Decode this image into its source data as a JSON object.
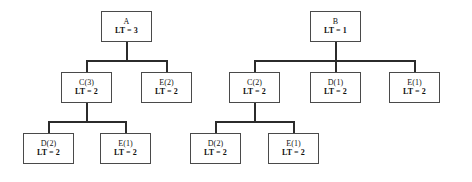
{
  "diagram": {
    "type": "tree",
    "title": "",
    "background_color": "#ffffff",
    "box_border_color": "#4a4a4a",
    "edge_color": "#2b2b2b",
    "text_color": "#111111",
    "trees": [
      {
        "name": "tree-a",
        "root": "A",
        "nodes": [
          {
            "id": "a-root",
            "name": "node-a-root",
            "label": "A",
            "value": "LT = 3",
            "lt": 3,
            "level": 0,
            "x": 101,
            "y": 11,
            "w": 51,
            "h": 31
          },
          {
            "id": "a-c3",
            "name": "node-a-c3",
            "label": "C(3)",
            "value": "LT = 2",
            "lt": 2,
            "level": 1,
            "x": 61,
            "y": 72,
            "w": 51,
            "h": 31
          },
          {
            "id": "a-e2",
            "name": "node-a-e2",
            "label": "E(2)",
            "value": "LT = 2",
            "lt": 2,
            "level": 1,
            "x": 141,
            "y": 72,
            "w": 51,
            "h": 31
          },
          {
            "id": "a-d2",
            "name": "node-a-d2",
            "label": "D(2)",
            "value": "LT = 2",
            "lt": 2,
            "level": 2,
            "x": 23,
            "y": 133,
            "w": 51,
            "h": 31
          },
          {
            "id": "a-e1",
            "name": "node-a-e1",
            "label": "E(1)",
            "value": "LT = 2",
            "lt": 2,
            "level": 2,
            "x": 100,
            "y": 133,
            "w": 51,
            "h": 31
          }
        ],
        "links": [
          {
            "name": "edge-a-root-to-children",
            "from": "a-root",
            "to": [
              "a-c3",
              "a-e2"
            ]
          },
          {
            "name": "edge-a-c3-to-children",
            "from": "a-c3",
            "to": [
              "a-d2",
              "a-e1"
            ]
          }
        ]
      },
      {
        "name": "tree-b",
        "root": "B",
        "nodes": [
          {
            "id": "b-root",
            "name": "node-b-root",
            "label": "B",
            "value": "LT = 1",
            "lt": 1,
            "level": 0,
            "x": 310,
            "y": 11,
            "w": 51,
            "h": 31
          },
          {
            "id": "b-c2",
            "name": "node-b-c2",
            "label": "C(2)",
            "value": "LT = 2",
            "lt": 2,
            "level": 1,
            "x": 229,
            "y": 72,
            "w": 51,
            "h": 31
          },
          {
            "id": "b-d1",
            "name": "node-b-d1",
            "label": "D(1)",
            "value": "LT = 2",
            "lt": 2,
            "level": 1,
            "x": 310,
            "y": 72,
            "w": 51,
            "h": 31
          },
          {
            "id": "b-e1-top",
            "name": "node-b-e1-level1",
            "label": "E(1)",
            "value": "LT = 2",
            "lt": 2,
            "level": 1,
            "x": 389,
            "y": 72,
            "w": 51,
            "h": 31
          },
          {
            "id": "b-d2",
            "name": "node-b-d2",
            "label": "D(2)",
            "value": "LT = 2",
            "lt": 2,
            "level": 2,
            "x": 190,
            "y": 133,
            "w": 51,
            "h": 31
          },
          {
            "id": "b-e1-bot",
            "name": "node-b-e1-level2",
            "label": "E(1)",
            "value": "LT = 2",
            "lt": 2,
            "level": 2,
            "x": 268,
            "y": 133,
            "w": 51,
            "h": 31
          }
        ],
        "links": [
          {
            "name": "edge-b-root-to-children",
            "from": "b-root",
            "to": [
              "b-c2",
              "b-d1",
              "b-e1-top"
            ]
          },
          {
            "name": "edge-b-c2-to-children",
            "from": "b-c2",
            "to": [
              "b-d2",
              "b-e1-bot"
            ]
          }
        ]
      }
    ],
    "edges": [
      {
        "name": "edge-a-root-stem",
        "orient": "v",
        "x": 126,
        "y": 42,
        "len": 19
      },
      {
        "name": "edge-a-root-bus",
        "orient": "h",
        "x": 86,
        "y": 60,
        "len": 81
      },
      {
        "name": "edge-a-c3-drop",
        "orient": "v",
        "x": 86,
        "y": 60,
        "len": 12
      },
      {
        "name": "edge-a-e2-drop",
        "orient": "v",
        "x": 166,
        "y": 60,
        "len": 12
      },
      {
        "name": "edge-a-c3-stem",
        "orient": "v",
        "x": 86,
        "y": 103,
        "len": 19
      },
      {
        "name": "edge-a-c3-bus",
        "orient": "h",
        "x": 48,
        "y": 121,
        "len": 78
      },
      {
        "name": "edge-a-d2-drop",
        "orient": "v",
        "x": 48,
        "y": 121,
        "len": 12
      },
      {
        "name": "edge-a-e1-drop",
        "orient": "v",
        "x": 125,
        "y": 121,
        "len": 12
      },
      {
        "name": "edge-b-root-stem",
        "orient": "v",
        "x": 335,
        "y": 42,
        "len": 19
      },
      {
        "name": "edge-b-root-bus",
        "orient": "h",
        "x": 254,
        "y": 60,
        "len": 161
      },
      {
        "name": "edge-b-c2-drop",
        "orient": "v",
        "x": 254,
        "y": 60,
        "len": 12
      },
      {
        "name": "edge-b-d1-drop",
        "orient": "v",
        "x": 335,
        "y": 60,
        "len": 12
      },
      {
        "name": "edge-b-e1-drop",
        "orient": "v",
        "x": 414,
        "y": 60,
        "len": 12
      },
      {
        "name": "edge-b-c2-stem",
        "orient": "v",
        "x": 254,
        "y": 103,
        "len": 19
      },
      {
        "name": "edge-b-c2-bus",
        "orient": "h",
        "x": 215,
        "y": 121,
        "len": 79
      },
      {
        "name": "edge-b-d2-drop",
        "orient": "v",
        "x": 215,
        "y": 121,
        "len": 12
      },
      {
        "name": "edge-b-e1-bot-drop",
        "orient": "v",
        "x": 293,
        "y": 121,
        "len": 12
      }
    ]
  }
}
